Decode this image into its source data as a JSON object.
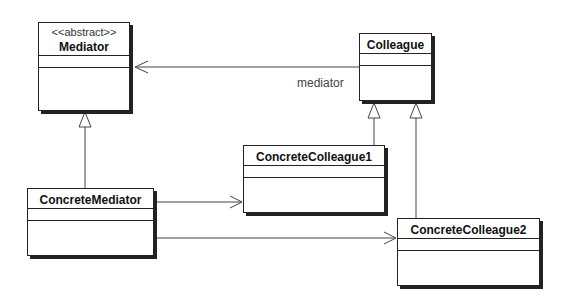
{
  "diagram": {
    "type": "UML class diagram",
    "classes": [
      {
        "id": "mediator",
        "stereotype": "<<abstract>>",
        "name": "Mediator"
      },
      {
        "id": "colleague",
        "name": "Colleague"
      },
      {
        "id": "concrete_mediator",
        "name": "ConcreteMediator"
      },
      {
        "id": "concrete_colleague1",
        "name": "ConcreteColleague1"
      },
      {
        "id": "concrete_colleague2",
        "name": "ConcreteColleague2"
      }
    ],
    "relationships": [
      {
        "from": "Colleague",
        "to": "Mediator",
        "type": "association",
        "role": "mediator"
      },
      {
        "from": "ConcreteMediator",
        "to": "Mediator",
        "type": "generalization"
      },
      {
        "from": "ConcreteColleague1",
        "to": "Colleague",
        "type": "generalization"
      },
      {
        "from": "ConcreteColleague2",
        "to": "Colleague",
        "type": "generalization"
      },
      {
        "from": "ConcreteMediator",
        "to": "ConcreteColleague1",
        "type": "association"
      },
      {
        "from": "ConcreteMediator",
        "to": "ConcreteColleague2",
        "type": "association"
      }
    ]
  },
  "labels": {
    "mediator_stereotype": "<<abstract>>",
    "mediator_name": "Mediator",
    "colleague_name": "Colleague",
    "concrete_mediator_name": "ConcreteMediator",
    "concrete_colleague1_name": "ConcreteColleague1",
    "concrete_colleague2_name": "ConcreteColleague2",
    "role_mediator": "mediator"
  }
}
